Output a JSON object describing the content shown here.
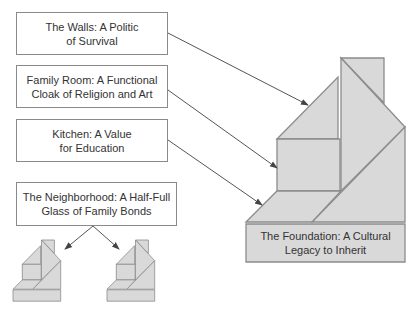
{
  "colors": {
    "fill": "#d9d9d9",
    "stroke": "#8c8c8c",
    "arrow": "#555555",
    "text": "#333333",
    "box_border": "#8a8a8a"
  },
  "labels": [
    {
      "id": "walls",
      "line1": "The Walls: A Politic",
      "line2": "of Survival",
      "x": 16,
      "y": 12,
      "w": 152,
      "h": 43
    },
    {
      "id": "family-room",
      "line1": "Family Room: A Functional",
      "line2": "Cloak of Religion and Art",
      "x": 16,
      "y": 65,
      "w": 152,
      "h": 43
    },
    {
      "id": "kitchen",
      "line1": "Kitchen: A Value",
      "line2": "for Education",
      "x": 16,
      "y": 119,
      "w": 152,
      "h": 43
    },
    {
      "id": "neighborhood",
      "line1": "The Neighborhood: A Half-Full",
      "line2": "Glass of Family Bonds",
      "x": 16,
      "y": 182,
      "w": 161,
      "h": 44
    }
  ],
  "foundation": {
    "line1": "The Foundation: A Cultural",
    "line2": "Legacy to Inherit"
  },
  "house": {
    "origin": [
      246,
      58
    ],
    "pieces": [
      {
        "name": "chimney",
        "points": [
          [
            95,
            0
          ],
          [
            138,
            0
          ],
          [
            138,
            45
          ]
        ]
      },
      {
        "name": "roof-left",
        "points": [
          [
            31,
            81
          ],
          [
            92,
            19
          ],
          [
            92,
            81
          ]
        ]
      },
      {
        "name": "family-room-block",
        "points": [
          [
            31,
            81
          ],
          [
            94,
            81
          ],
          [
            94,
            133
          ],
          [
            31,
            133
          ]
        ]
      },
      {
        "name": "center-column",
        "points": [
          [
            95,
            0
          ],
          [
            159,
            69
          ],
          [
            95,
            133
          ]
        ]
      },
      {
        "name": "right-lower",
        "points": [
          [
            159,
            69
          ],
          [
            159,
            164
          ],
          [
            66,
            164
          ]
        ]
      },
      {
        "name": "kitchen-step",
        "points": [
          [
            0,
            164
          ],
          [
            31,
            133
          ],
          [
            95,
            133
          ],
          [
            66,
            164
          ]
        ]
      },
      {
        "name": "foundation-block",
        "points": [
          [
            0,
            166
          ],
          [
            159,
            166
          ],
          [
            159,
            204
          ],
          [
            0,
            204
          ]
        ]
      }
    ]
  },
  "mini_houses": [
    {
      "name": "neighbor-house-left",
      "origin": [
        13,
        240
      ],
      "scale": 0.3
    },
    {
      "name": "neighbor-house-right",
      "origin": [
        107,
        240
      ],
      "scale": 0.3
    }
  ],
  "arrows": [
    {
      "name": "walls-arrow",
      "from": [
        168,
        33
      ],
      "to": [
        308,
        105
      ]
    },
    {
      "name": "family-room-arrow",
      "from": [
        168,
        90
      ],
      "to": [
        277,
        168
      ]
    },
    {
      "name": "kitchen-arrow",
      "from": [
        168,
        140
      ],
      "to": [
        262,
        205
      ]
    },
    {
      "name": "neighborhood-arrow-left",
      "from": [
        93,
        226
      ],
      "to": [
        65,
        249
      ]
    },
    {
      "name": "neighborhood-arrow-right",
      "from": [
        93,
        226
      ],
      "to": [
        119,
        249
      ]
    }
  ]
}
